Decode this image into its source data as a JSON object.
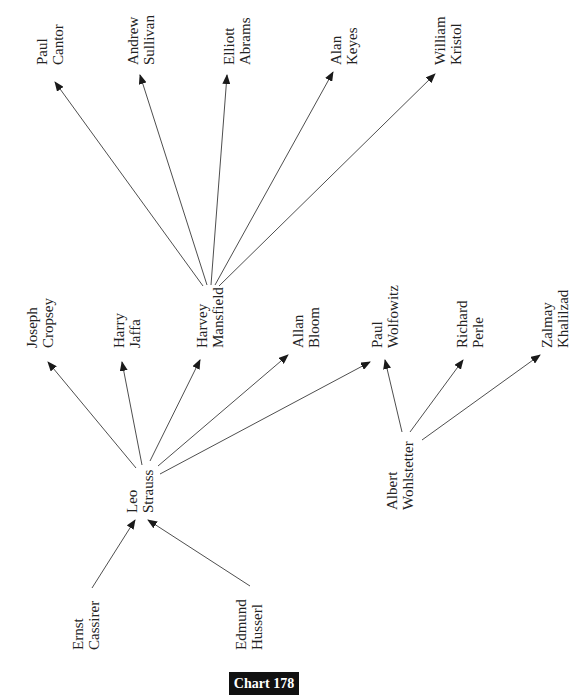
{
  "figure": {
    "caption": "Chart 178",
    "text_orientation": "rotated -90deg (reads bottom to top)",
    "colors": {
      "line": "#3a3a3a",
      "text": "#222222",
      "badge_bg": "#111111",
      "badge_text": "#ffffff"
    }
  },
  "nodes": [
    {
      "id": "cassirer",
      "line1": "Ernst",
      "line2": "Cassirer",
      "x": 86,
      "y": 650
    },
    {
      "id": "husserl",
      "line1": "Edmund",
      "line2": "Husserl",
      "x": 249,
      "y": 650
    },
    {
      "id": "strauss",
      "line1": "Leo",
      "line2": "Strauss",
      "x": 140,
      "y": 513
    },
    {
      "id": "wohlstetter",
      "line1": "Albert",
      "line2": "Wohlstetter",
      "x": 400,
      "y": 510
    },
    {
      "id": "cropsey",
      "line1": "Joseph",
      "line2": "Cropsey",
      "x": 40,
      "y": 348
    },
    {
      "id": "jaffa",
      "line1": "Harry",
      "line2": "Jaffa",
      "x": 127,
      "y": 348
    },
    {
      "id": "mansfield",
      "line1": "Harvey",
      "line2": "Mansfield",
      "x": 210,
      "y": 348
    },
    {
      "id": "bloom",
      "line1": "Allan",
      "line2": "Bloom",
      "x": 306,
      "y": 348
    },
    {
      "id": "wolfowitz",
      "line1": "Paul",
      "line2": "Wolfowitz",
      "x": 385,
      "y": 348
    },
    {
      "id": "perle",
      "line1": "Richard",
      "line2": "Perle",
      "x": 470,
      "y": 348
    },
    {
      "id": "khalilzad",
      "line1": "Zalmay",
      "line2": "Khalilzad",
      "x": 555,
      "y": 348
    },
    {
      "id": "cantor",
      "line1": "Paul",
      "line2": "Cantor",
      "x": 50,
      "y": 65
    },
    {
      "id": "sullivan",
      "line1": "Andrew",
      "line2": "Sullivan",
      "x": 141,
      "y": 65
    },
    {
      "id": "abrams",
      "line1": "Elliott",
      "line2": "Abrams",
      "x": 237,
      "y": 65
    },
    {
      "id": "keyes",
      "line1": "Alan",
      "line2": "Keyes",
      "x": 344,
      "y": 65
    },
    {
      "id": "kristol",
      "line1": "William",
      "line2": "Kristol",
      "x": 448,
      "y": 65
    }
  ],
  "edges": [
    {
      "from": "cassirer",
      "to": "strauss",
      "x1": 92,
      "y1": 588,
      "x2": 135,
      "y2": 520
    },
    {
      "from": "husserl",
      "to": "strauss",
      "x1": 250,
      "y1": 586,
      "x2": 148,
      "y2": 520
    },
    {
      "from": "strauss",
      "to": "cropsey",
      "x1": 136,
      "y1": 468,
      "x2": 48,
      "y2": 362
    },
    {
      "from": "strauss",
      "to": "jaffa",
      "x1": 142,
      "y1": 465,
      "x2": 122,
      "y2": 362
    },
    {
      "from": "strauss",
      "to": "mansfield",
      "x1": 150,
      "y1": 461,
      "x2": 200,
      "y2": 360
    },
    {
      "from": "strauss",
      "to": "bloom",
      "x1": 158,
      "y1": 466,
      "x2": 288,
      "y2": 355
    },
    {
      "from": "strauss",
      "to": "wolfowitz",
      "x1": 160,
      "y1": 474,
      "x2": 370,
      "y2": 362
    },
    {
      "from": "wohlstetter",
      "to": "wolfowitz",
      "x1": 402,
      "y1": 432,
      "x2": 385,
      "y2": 360
    },
    {
      "from": "wohlstetter",
      "to": "perle",
      "x1": 410,
      "y1": 432,
      "x2": 463,
      "y2": 360
    },
    {
      "from": "wohlstetter",
      "to": "khalilzad",
      "x1": 422,
      "y1": 440,
      "x2": 540,
      "y2": 355
    },
    {
      "from": "mansfield",
      "to": "cantor",
      "x1": 203,
      "y1": 286,
      "x2": 55,
      "y2": 82
    },
    {
      "from": "mansfield",
      "to": "sullivan",
      "x1": 207,
      "y1": 285,
      "x2": 140,
      "y2": 75
    },
    {
      "from": "mansfield",
      "to": "abrams",
      "x1": 211,
      "y1": 285,
      "x2": 227,
      "y2": 75
    },
    {
      "from": "mansfield",
      "to": "keyes",
      "x1": 215,
      "y1": 285,
      "x2": 333,
      "y2": 72
    },
    {
      "from": "mansfield",
      "to": "kristol",
      "x1": 219,
      "y1": 286,
      "x2": 435,
      "y2": 74
    }
  ]
}
